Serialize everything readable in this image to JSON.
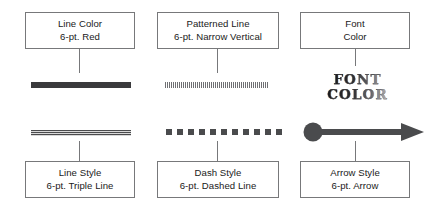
{
  "figure": {
    "background_color": "#ffffff",
    "box_border_color": "#77787a",
    "ink_color": "#3a3a3c",
    "text_color": "#1a1a1a"
  },
  "top_row": [
    {
      "id": "line-color",
      "title": "Line Color",
      "spec": "6-pt. Red",
      "sample_kind": "solid-line",
      "sample_color": "#3a3a3c"
    },
    {
      "id": "patterned-line",
      "title": "Patterned Line",
      "spec": "6-pt. Narrow Vertical",
      "sample_kind": "vertical-hatch-line",
      "sample_color": "#6f7073"
    },
    {
      "id": "font-color",
      "title": "Font",
      "spec": "Color",
      "sample_kind": "font-color-art",
      "sample_color": "#2b2b2d"
    }
  ],
  "bottom_row": [
    {
      "id": "line-style",
      "title": "Line Style",
      "spec": "6-pt. Triple Line",
      "sample_kind": "triple-line",
      "sample_color": "#4a4b4d"
    },
    {
      "id": "dash-style",
      "title": "Dash Style",
      "spec": "6-pt. Dashed Line",
      "sample_kind": "square-dashed-line",
      "sample_color": "#4a4b4d",
      "dash_count": 11
    },
    {
      "id": "arrow-style",
      "title": "Arrow Style",
      "spec": "6-pt. Arrow",
      "sample_kind": "arrow-with-dot",
      "sample_color": "#4a4b4d"
    }
  ],
  "font_color_art": {
    "line1": "FONT",
    "line2": "COLOR"
  }
}
